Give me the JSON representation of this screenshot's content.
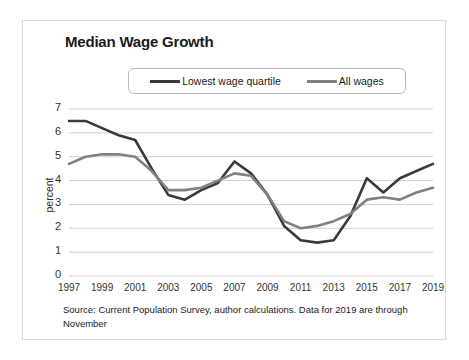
{
  "chart_data": {
    "type": "line",
    "title": "Median Wage Growth",
    "xlabel": "",
    "ylabel": "percent",
    "ylim": [
      0,
      7
    ],
    "xlim": [
      1997,
      2019
    ],
    "grid": true,
    "legend_position": "top",
    "y_ticks": [
      "7",
      "6",
      "5",
      "4",
      "3",
      "2",
      "1",
      "0"
    ],
    "x_ticks": [
      "1997",
      "1999",
      "2001",
      "2003",
      "2005",
      "2007",
      "2009",
      "2011",
      "2013",
      "2015",
      "2017",
      "2019"
    ],
    "x": [
      1997,
      1998,
      1999,
      2000,
      2001,
      2002,
      2003,
      2004,
      2005,
      2006,
      2007,
      2008,
      2009,
      2010,
      2011,
      2012,
      2013,
      2014,
      2015,
      2016,
      2017,
      2018,
      2019
    ],
    "series": [
      {
        "name": "Lowest wage quartile",
        "color": "#3a3a3a",
        "values": [
          6.5,
          6.5,
          6.2,
          5.9,
          5.7,
          4.5,
          3.4,
          3.2,
          3.6,
          3.9,
          4.8,
          4.3,
          3.4,
          2.1,
          1.5,
          1.4,
          1.5,
          2.5,
          4.1,
          3.5,
          4.1,
          4.4,
          4.7
        ]
      },
      {
        "name": "All wages",
        "color": "#808080",
        "values": [
          4.7,
          5.0,
          5.1,
          5.1,
          5.0,
          4.4,
          3.6,
          3.6,
          3.7,
          4.0,
          4.3,
          4.2,
          3.4,
          2.3,
          2.0,
          2.1,
          2.3,
          2.6,
          3.2,
          3.3,
          3.2,
          3.5,
          3.7
        ]
      }
    ],
    "source_note": "Source: Current Population Survey, author calculations. Data for 2019 are through November"
  },
  "legend": {
    "entries": [
      {
        "label": "Lowest wage quartile"
      },
      {
        "label": "All wages"
      }
    ]
  },
  "colors": {
    "lowest_quartile": "#3a3a3a",
    "all_wages": "#808080",
    "gridline": "#d0d0d0",
    "frame": "#d9d9d9"
  }
}
